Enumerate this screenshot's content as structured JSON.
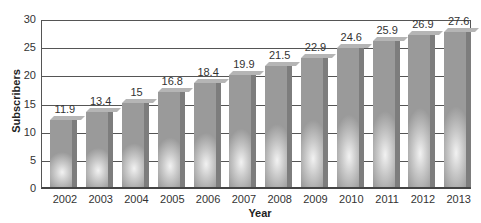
{
  "chart_data": {
    "type": "bar",
    "title": "",
    "xlabel": "Year",
    "ylabel": "Subscribers",
    "categories": [
      "2002",
      "2003",
      "2004",
      "2005",
      "2006",
      "2007",
      "2008",
      "2009",
      "2010",
      "2011",
      "2012",
      "2013"
    ],
    "values": [
      11.9,
      13.4,
      15,
      16.8,
      18.4,
      19.9,
      21.5,
      22.9,
      24.6,
      25.9,
      26.9,
      27.6
    ],
    "value_labels": [
      "11.9",
      "13.4",
      "15",
      "16.8",
      "18.4",
      "19.9",
      "21.5",
      "22.9",
      "24.6",
      "25.9",
      "26.9",
      "27.6"
    ],
    "ylim": [
      0,
      30
    ],
    "yticks": [
      "0",
      "5",
      "10",
      "15",
      "20",
      "25",
      "30"
    ],
    "grid": true,
    "legend": null,
    "bar_style": "3D gray gradient"
  }
}
